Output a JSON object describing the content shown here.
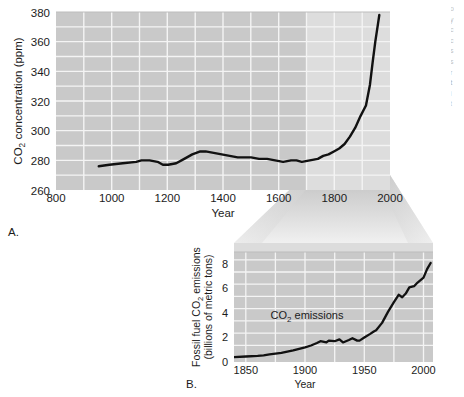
{
  "figure": {
    "background_color": "#ffffff",
    "plot_fill_color": "#c9c9c9",
    "plot_highlight_color": "#dedede",
    "gridline_color": "#f2f2f2",
    "line_color": "#111111",
    "funnel_color": "#dcdcdc"
  },
  "panel_a": {
    "label": "A.",
    "y_axis_title_part1": "CO",
    "y_axis_title_sub": "2",
    "y_axis_title_part2": " concentration (ppm)",
    "x_axis_title": "Year",
    "y_ticks": [
      "260",
      "280",
      "300",
      "320",
      "340",
      "360",
      "380"
    ],
    "x_ticks": [
      "800",
      "1000",
      "1200",
      "1400",
      "1600",
      "1800",
      "2000"
    ],
    "highlight_from_year": "1800",
    "highlight_to_year": "2000"
  },
  "panel_b": {
    "label": "B.",
    "y_axis_title_line1_part1": "Fossil fuel CO",
    "y_axis_title_line1_sub": "2",
    "y_axis_title_line1_part2": " emissions",
    "y_axis_title_line2": "(billions of metric tons)",
    "x_axis_title": "Year",
    "y_ticks": [
      "0",
      "2",
      "4",
      "6",
      "8"
    ],
    "x_ticks": [
      "1850",
      "1900",
      "1950",
      "2000"
    ],
    "series_annotation_part1": "CO",
    "series_annotation_sub": "2",
    "series_annotation_part2": " emissions"
  },
  "edge_bleed": {
    "lines": [
      "o",
      "y",
      "c",
      "c",
      "s",
      "s",
      "r",
      "t",
      "i",
      "t"
    ]
  },
  "chart_data": [
    {
      "id": "panel-a",
      "type": "line",
      "title": "",
      "xlabel": "Year",
      "ylabel": "CO2 concentration (ppm)",
      "xlim": [
        800,
        2050
      ],
      "ylim": [
        260,
        380
      ],
      "xticks": [
        800,
        1000,
        1200,
        1400,
        1600,
        1800,
        2000
      ],
      "yticks": [
        260,
        280,
        300,
        320,
        340,
        360,
        380
      ],
      "grid": true,
      "legend": "none",
      "highlight_band": [
        1800,
        2050
      ],
      "series": [
        {
          "name": "Atmospheric CO2 concentration",
          "x": [
            960,
            1000,
            1050,
            1100,
            1120,
            1150,
            1180,
            1200,
            1220,
            1250,
            1280,
            1310,
            1340,
            1360,
            1390,
            1420,
            1450,
            1480,
            1500,
            1530,
            1560,
            1590,
            1620,
            1650,
            1680,
            1700,
            1720,
            1750,
            1780,
            1800,
            1820,
            1840,
            1860,
            1880,
            1900,
            1920,
            1940,
            1960,
            1975,
            1985,
            1995,
            2005,
            2010
          ],
          "y": [
            276,
            277,
            278,
            279,
            280,
            280,
            279,
            277,
            277,
            278,
            281,
            284,
            286,
            286,
            285,
            284,
            283,
            282,
            282,
            282,
            281,
            281,
            280,
            279,
            280,
            280,
            279,
            280,
            281,
            283,
            284,
            286,
            288,
            291,
            296,
            302,
            310,
            317,
            331,
            346,
            360,
            372,
            378
          ]
        }
      ]
    },
    {
      "id": "panel-b",
      "type": "line",
      "title": "",
      "xlabel": "Year",
      "ylabel": "Fossil fuel CO2 emissions (billions of metric tons)",
      "xlim": [
        1840,
        2008
      ],
      "ylim": [
        0,
        9
      ],
      "xticks": [
        1850,
        1900,
        1950,
        2000
      ],
      "yticks": [
        0,
        2,
        4,
        6,
        8
      ],
      "grid": true,
      "legend": "none",
      "annotation": "CO2 emissions",
      "series": [
        {
          "name": "Fossil fuel CO2 emissions",
          "x": [
            1840,
            1850,
            1860,
            1865,
            1870,
            1880,
            1890,
            1900,
            1905,
            1910,
            1913,
            1918,
            1920,
            1925,
            1929,
            1932,
            1937,
            1940,
            1944,
            1946,
            1950,
            1955,
            1958,
            1960,
            1965,
            1970,
            1975,
            1979,
            1982,
            1985,
            1988,
            1992,
            1995,
            2000,
            2003,
            2006
          ],
          "y": [
            0.4,
            0.45,
            0.5,
            0.55,
            0.62,
            0.75,
            0.95,
            1.2,
            1.35,
            1.55,
            1.7,
            1.6,
            1.75,
            1.7,
            1.85,
            1.6,
            1.8,
            1.95,
            1.75,
            1.75,
            2.0,
            2.3,
            2.5,
            2.6,
            3.2,
            4.1,
            4.9,
            5.5,
            5.3,
            5.6,
            6.1,
            6.2,
            6.5,
            6.9,
            7.6,
            8.1
          ]
        }
      ]
    }
  ]
}
